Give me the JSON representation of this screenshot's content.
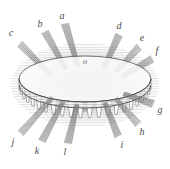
{
  "figure": {
    "background_color": "#ffffff",
    "ink_color": "#555555",
    "halo_color": "#b9b9b9",
    "label_color": "#4a4a4a",
    "width": 170,
    "height": 169
  },
  "structure": {
    "center_x": 85,
    "center_y": 85,
    "ring_radius_x": 66,
    "ring_radius_y": 23,
    "ring_band_height": 16,
    "tooth_count": 22,
    "halo_radius_x": 74,
    "halo_radius_y": 42
  },
  "ray_labels": [
    {
      "id": "a",
      "text": "a",
      "x": 62,
      "y": 16,
      "angle_deg": 101,
      "inner_x": 78,
      "inner_y": 66,
      "outer_x": 65,
      "outer_y": 24,
      "bundle_width": 7
    },
    {
      "id": "b",
      "text": "b",
      "x": 40,
      "y": 24,
      "angle_deg": 118,
      "inner_x": 66,
      "inner_y": 69,
      "outer_x": 45,
      "outer_y": 32,
      "bundle_width": 7
    },
    {
      "id": "c",
      "text": "c",
      "x": 11,
      "y": 33,
      "angle_deg": 140,
      "inner_x": 50,
      "inner_y": 74,
      "outer_x": 20,
      "outer_y": 44,
      "bundle_width": 7
    },
    {
      "id": "d",
      "text": "d",
      "x": 119,
      "y": 26,
      "angle_deg": 62,
      "inner_x": 104,
      "inner_y": 68,
      "outer_x": 119,
      "outer_y": 35,
      "bundle_width": 7
    },
    {
      "id": "e",
      "text": "e",
      "x": 142,
      "y": 38,
      "angle_deg": 42,
      "inner_x": 116,
      "inner_y": 72,
      "outer_x": 139,
      "outer_y": 47,
      "bundle_width": 7
    },
    {
      "id": "f",
      "text": "f",
      "x": 157,
      "y": 51,
      "angle_deg": 28,
      "inner_x": 123,
      "inner_y": 76,
      "outer_x": 152,
      "outer_y": 59,
      "bundle_width": 7
    },
    {
      "id": "g",
      "text": "g",
      "x": 160,
      "y": 110,
      "angle_deg": -26,
      "inner_x": 124,
      "inner_y": 94,
      "outer_x": 153,
      "outer_y": 104,
      "bundle_width": 7
    },
    {
      "id": "h",
      "text": "h",
      "x": 142,
      "y": 132,
      "angle_deg": -46,
      "inner_x": 116,
      "inner_y": 99,
      "outer_x": 138,
      "outer_y": 124,
      "bundle_width": 7
    },
    {
      "id": "i",
      "text": "i",
      "x": 122,
      "y": 145,
      "angle_deg": -64,
      "inner_x": 105,
      "inner_y": 103,
      "outer_x": 118,
      "outer_y": 136,
      "bundle_width": 7
    },
    {
      "id": "j",
      "text": "j",
      "x": 13,
      "y": 142,
      "angle_deg": -136,
      "inner_x": 52,
      "inner_y": 98,
      "outer_x": 21,
      "outer_y": 133,
      "bundle_width": 7
    },
    {
      "id": "k",
      "text": "k",
      "x": 37,
      "y": 151,
      "angle_deg": -114,
      "inner_x": 63,
      "inner_y": 102,
      "outer_x": 42,
      "outer_y": 141,
      "bundle_width": 7
    },
    {
      "id": "l",
      "text": "l",
      "x": 65,
      "y": 152,
      "angle_deg": -96,
      "inner_x": 77,
      "inner_y": 105,
      "outer_x": 68,
      "outer_y": 143,
      "bundle_width": 7
    }
  ],
  "face_labels": [
    {
      "id": "o-upper",
      "text": "o",
      "x": 85,
      "y": 62
    },
    {
      "id": "o-lower",
      "text": "o",
      "x": 85,
      "y": 110
    }
  ]
}
